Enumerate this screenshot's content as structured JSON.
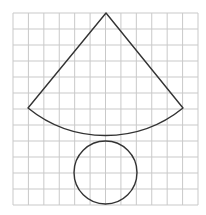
{
  "figure": {
    "width": 206,
    "height": 215,
    "background": "#ffffff",
    "grid": {
      "columns": 12,
      "rows": 12,
      "x0": 13,
      "y0": 13,
      "x1": 198,
      "y1": 205,
      "color": "#c9c9c9",
      "stroke_width": 1
    },
    "sector": {
      "apex": [
        106,
        13
      ],
      "left_end": [
        28,
        108
      ],
      "right_end": [
        183,
        108
      ],
      "arc_bottom": [
        106,
        140
      ],
      "color": "#333333",
      "stroke_width": 1.4
    },
    "circle": {
      "center": [
        105.5,
        172.5
      ],
      "radius": 31.5,
      "color": "#333333",
      "stroke_width": 1.4
    }
  }
}
